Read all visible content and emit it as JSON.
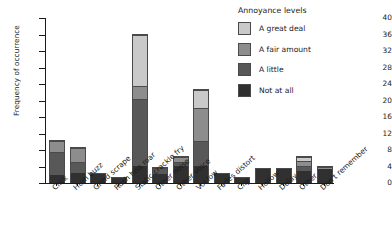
{
  "chart_data": {
    "type": "bar",
    "stacked": true,
    "title": "",
    "xlabel": "",
    "ylabel": "Frequency of occurrence",
    "ylim": [
      0,
      40
    ],
    "yticks": [
      0,
      4,
      8,
      12,
      16,
      20,
      24,
      28,
      32,
      36,
      40
    ],
    "grid": false,
    "legend_title": "Annoyance levels",
    "legend_position": "top-right",
    "categories": [
      "Click",
      "Hum buzz",
      "Grind scrape",
      "Rush hiss roar",
      "Static crackle fry",
      "Other noise",
      "Other voice",
      "Vol low",
      "Fades distort",
      "Clip",
      "Hollow",
      "Delay",
      "Other",
      "Don't remember"
    ],
    "series": [
      {
        "name": "Not at all",
        "color": "#303030",
        "values": [
          2.0,
          2.5,
          2.2,
          1.3,
          4.2,
          2.3,
          4.1,
          4.2,
          2.3,
          1.3,
          3.4,
          3.4,
          2.8,
          3.4
        ]
      },
      {
        "name": "A little",
        "color": "#585858",
        "values": [
          5.5,
          2.7,
          0.0,
          0.0,
          16.1,
          1.4,
          0.9,
          5.9,
          0.0,
          0.0,
          0.0,
          0.0,
          1.4,
          0.0
        ]
      },
      {
        "name": "A fair amount",
        "color": "#8d8d8d",
        "values": [
          2.8,
          3.3,
          0.0,
          0.0,
          3.3,
          0.0,
          1.4,
          8.0,
          0.0,
          0.0,
          0.0,
          0.0,
          1.1,
          0.6
        ]
      },
      {
        "name": "A great deal",
        "color": "#c9c9c9",
        "values": [
          0.0,
          0.0,
          0.0,
          0.0,
          12.4,
          0.0,
          0.0,
          4.4,
          0.0,
          0.0,
          0.0,
          0.0,
          1.1,
          0.0
        ]
      }
    ],
    "totals": [
      10.3,
      8.5,
      2.2,
      1.3,
      36.0,
      3.7,
      6.4,
      22.5,
      2.3,
      1.3,
      3.4,
      3.4,
      6.4,
      4.0
    ]
  }
}
